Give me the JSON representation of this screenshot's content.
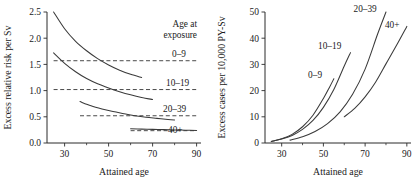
{
  "figure": {
    "panels": [
      {
        "id": "left",
        "chart_index": 0
      },
      {
        "id": "right",
        "chart_index": 1
      }
    ]
  },
  "chart_data": [
    {
      "type": "line",
      "title": "",
      "xlabel": "Attained age",
      "ylabel": "Excess relative risk per Sv",
      "xlim": [
        22,
        92
      ],
      "ylim": [
        0.0,
        2.5
      ],
      "xticks": [
        30,
        50,
        70,
        90
      ],
      "xticklabels": [
        "30",
        "50",
        "70",
        "90"
      ],
      "yticks": [
        0.0,
        0.5,
        1.0,
        1.5,
        2.0,
        2.5
      ],
      "yticklabels": [
        "0.0",
        "0.5",
        "1.0",
        "1.5",
        "2.0",
        "2.5"
      ],
      "minor_xticks": [
        40,
        60,
        80
      ],
      "grid": false,
      "legend": {
        "position": "right",
        "title_line1": "Age at",
        "title_line2": "exposure",
        "entries": [
          "0–9",
          "10–19",
          "20–39",
          "40+"
        ]
      },
      "series": [
        {
          "name": "0–9",
          "x": [
            25,
            30,
            35,
            40,
            45,
            50,
            55,
            60,
            65
          ],
          "values": [
            2.5,
            2.18,
            1.94,
            1.76,
            1.61,
            1.49,
            1.39,
            1.31,
            1.25
          ]
        },
        {
          "name": "10–19",
          "x": [
            25,
            30,
            35,
            40,
            45,
            50,
            55,
            60,
            65,
            70
          ],
          "values": [
            1.72,
            1.52,
            1.36,
            1.23,
            1.13,
            1.05,
            0.98,
            0.92,
            0.87,
            0.83
          ]
        },
        {
          "name": "20–39",
          "x": [
            37,
            42,
            47,
            52,
            57,
            62,
            67,
            72,
            77,
            80
          ],
          "values": [
            0.79,
            0.71,
            0.65,
            0.6,
            0.56,
            0.52,
            0.49,
            0.47,
            0.45,
            0.44
          ]
        },
        {
          "name": "40+",
          "x": [
            60,
            65,
            70,
            75,
            80,
            85,
            90
          ],
          "values": [
            0.27,
            0.265,
            0.26,
            0.255,
            0.25,
            0.245,
            0.24
          ]
        }
      ],
      "reference_lines": [
        {
          "name": "0–9 average",
          "y": 1.57,
          "x_start": 25,
          "x_end": 90
        },
        {
          "name": "10–19 average",
          "y": 1.02,
          "x_start": 25,
          "x_end": 90
        },
        {
          "name": "20–39 average",
          "y": 0.52,
          "x_start": 37,
          "x_end": 90
        },
        {
          "name": "40+ average",
          "y": 0.235,
          "x_start": 60,
          "x_end": 90
        }
      ]
    },
    {
      "type": "line",
      "title": "",
      "xlabel": "Attained age",
      "ylabel": "Excess cases per 10,000 PY-Sv",
      "xlim": [
        22,
        92
      ],
      "ylim": [
        0,
        50
      ],
      "xticks": [
        30,
        50,
        70,
        90
      ],
      "xticklabels": [
        "30",
        "50",
        "70",
        "90"
      ],
      "yticks": [
        0,
        10,
        20,
        30,
        40,
        50
      ],
      "yticklabels": [
        "0",
        "10",
        "20",
        "30",
        "40",
        "50"
      ],
      "minor_xticks": [
        40,
        60,
        80
      ],
      "grid": false,
      "legend": {
        "position": "inline"
      },
      "series": [
        {
          "name": "0–9",
          "label_x": 46,
          "label_y": 25,
          "x": [
            25,
            30,
            35,
            40,
            45,
            50,
            53,
            55
          ],
          "values": [
            0.6,
            1.6,
            3.3,
            6.2,
            10.6,
            17.0,
            21.4,
            24.5
          ]
        },
        {
          "name": "10–19",
          "label_x": 53,
          "label_y": 36,
          "x": [
            25,
            30,
            35,
            40,
            45,
            50,
            55,
            60,
            63
          ],
          "values": [
            0.6,
            1.5,
            2.9,
            5.2,
            8.6,
            13.6,
            20.4,
            29.4,
            34.5
          ]
        },
        {
          "name": "20–39",
          "label_x": 70,
          "label_y": 50,
          "x": [
            34,
            40,
            46,
            52,
            58,
            64,
            70,
            76,
            80
          ],
          "values": [
            1.1,
            2.4,
            4.4,
            7.4,
            11.9,
            18.6,
            28.2,
            41.6,
            50.0
          ]
        },
        {
          "name": "40+",
          "label_x": 83,
          "label_y": 44,
          "x": [
            60,
            65,
            70,
            75,
            80,
            85,
            90
          ],
          "values": [
            10.0,
            13.2,
            17.6,
            23.2,
            30.2,
            37.2,
            44.5
          ]
        }
      ]
    }
  ]
}
